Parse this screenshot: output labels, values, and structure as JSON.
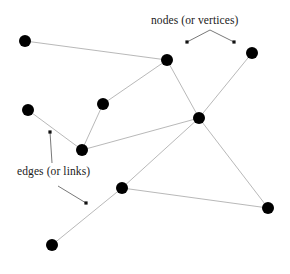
{
  "figure": {
    "kind": "graph-diagram",
    "background_color": "#ffffff",
    "width": 290,
    "height": 274
  },
  "style": {
    "node_color": "#000000",
    "node_radius": 6,
    "edge_color": "#b0b0b0",
    "edge_width": 0.9,
    "annotation_color": "#1a1a1a",
    "annotation_line_color": "#555555"
  },
  "annotations": [
    {
      "id": "nodes",
      "text": "nodes (or vertices)",
      "x": 151,
      "y": 14,
      "leaders": [
        {
          "from": [
            210,
            30
          ],
          "to": [
            187,
            42
          ]
        },
        {
          "from": [
            210,
            30
          ],
          "to": [
            234,
            42
          ]
        }
      ]
    },
    {
      "id": "edges",
      "text": "edges (or links)",
      "x": 17,
      "y": 165,
      "leaders": [
        {
          "from": [
            52,
            163
          ],
          "to": [
            50,
            132
          ]
        },
        {
          "from": [
            58,
            186
          ],
          "to": [
            86,
            203
          ]
        }
      ]
    }
  ],
  "graph": {
    "nodes": [
      {
        "id": "n1",
        "label": "top-left",
        "x": 25,
        "y": 41
      },
      {
        "id": "n2",
        "label": "mid-left",
        "x": 28,
        "y": 110
      },
      {
        "id": "n3",
        "label": "inner-left",
        "x": 103,
        "y": 104
      },
      {
        "id": "n4",
        "label": "lower-left-mid",
        "x": 82,
        "y": 150
      },
      {
        "id": "n5",
        "label": "upper-center",
        "x": 167,
        "y": 60
      },
      {
        "id": "n6",
        "label": "hub-center",
        "x": 199,
        "y": 118
      },
      {
        "id": "n7",
        "label": "top-right",
        "x": 252,
        "y": 53
      },
      {
        "id": "n8",
        "label": "lower-center",
        "x": 122,
        "y": 188
      },
      {
        "id": "n9",
        "label": "bottom-right",
        "x": 268,
        "y": 208
      },
      {
        "id": "n10",
        "label": "bottom-left",
        "x": 52,
        "y": 245
      }
    ],
    "edges": [
      {
        "source": "n1",
        "target": "n5"
      },
      {
        "source": "n2",
        "target": "n4"
      },
      {
        "source": "n3",
        "target": "n4"
      },
      {
        "source": "n3",
        "target": "n5"
      },
      {
        "source": "n4",
        "target": "n6"
      },
      {
        "source": "n5",
        "target": "n6"
      },
      {
        "source": "n6",
        "target": "n7"
      },
      {
        "source": "n6",
        "target": "n8"
      },
      {
        "source": "n6",
        "target": "n9"
      },
      {
        "source": "n8",
        "target": "n9"
      },
      {
        "source": "n8",
        "target": "n10"
      }
    ],
    "counts": {
      "node_count": 10,
      "edge_count": 11
    }
  }
}
